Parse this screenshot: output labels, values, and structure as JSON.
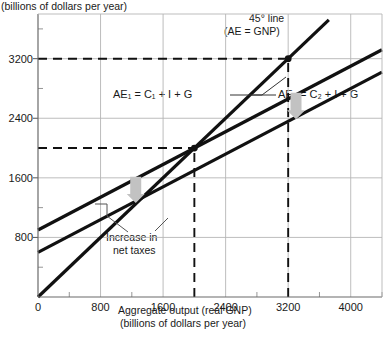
{
  "chart_data": {
    "type": "line",
    "title": "",
    "ylabel_top": "(billions of dollars per year)",
    "xlabel_line1": "Aggregate output (real GNP)",
    "xlabel_line2": "(billions of dollars per year)",
    "xlim": [
      0,
      4400
    ],
    "ylim": [
      0,
      3800
    ],
    "xticks": [
      0,
      800,
      1600,
      2400,
      3200,
      4000
    ],
    "xticklabels": [
      "0",
      "800",
      "1600",
      "2400",
      "3200",
      "4000"
    ],
    "yticks": [
      800,
      1600,
      2400,
      3200
    ],
    "yticklabels": [
      "800",
      "1600",
      "2400",
      "3200"
    ],
    "xminorticks": [
      400,
      1200,
      2000,
      2800,
      3600,
      4400
    ],
    "yminorticks": [
      400,
      1200,
      2000,
      2800,
      3600
    ],
    "grid": true,
    "grid_color": "#b5b5b5",
    "series": [
      {
        "name": "45° line (AE = GNP)",
        "type": "line",
        "intercept": 0,
        "slope": 1,
        "x": [
          0,
          3720
        ],
        "y": [
          0,
          3720
        ],
        "color": "#111111",
        "width": 3.2
      },
      {
        "name": "AE1 = C1 + I + G",
        "type": "line",
        "intercept": 900,
        "slope": 0.55,
        "x": [
          0,
          4400
        ],
        "y": [
          900,
          3320
        ],
        "color": "#111111",
        "width": 3.2
      },
      {
        "name": "AE2 = C2 + I + G",
        "type": "line",
        "intercept": 600,
        "slope": 0.55,
        "x": [
          0,
          4400
        ],
        "y": [
          600,
          3020
        ],
        "color": "#111111",
        "width": 3.2
      }
    ],
    "equilibria": [
      {
        "label": "new equilibrium",
        "x": 2000,
        "y": 2000,
        "marker": "dot"
      },
      {
        "label": "initial equilibrium",
        "x": 3200,
        "y": 3200,
        "marker": "dot"
      }
    ],
    "guide_lines": [
      {
        "orientation": "horizontal",
        "value": 3200,
        "style": "dashed",
        "from_x": 0,
        "to_x": 3200
      },
      {
        "orientation": "horizontal",
        "value": 2000,
        "style": "dashed",
        "from_x": 0,
        "to_x": 2000
      },
      {
        "orientation": "vertical",
        "value": 3200,
        "style": "dashed",
        "from_y": 0,
        "to_y": 3200
      },
      {
        "orientation": "vertical",
        "value": 2000,
        "style": "dashed",
        "from_y": 0,
        "to_y": 2000
      }
    ],
    "annotations": [
      {
        "name": "line-45-label-1",
        "text": "45° line"
      },
      {
        "name": "line-45-label-2",
        "text": "(AE  =  GNP)"
      },
      {
        "name": "ae1-label",
        "text": "AE₁  =  C₁ + I + G"
      },
      {
        "name": "ae2-label",
        "text": "AE₂  =  C₂ + I + G"
      },
      {
        "name": "net-taxes-label-1",
        "text": "Increase in"
      },
      {
        "name": "net-taxes-label-2",
        "text": "net taxes"
      }
    ],
    "shift_arrows": [
      {
        "name": "shift-arrow-upper",
        "x": 3300,
        "direction": "down",
        "color": "#c2c2c2"
      },
      {
        "name": "shift-arrow-lower",
        "x": 1250,
        "direction": "down",
        "color": "#c2c2c2"
      }
    ]
  }
}
